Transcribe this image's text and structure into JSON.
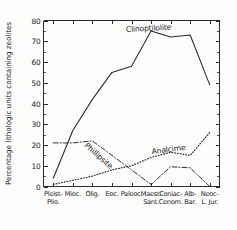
{
  "chart_data": {
    "type": "line",
    "title": "",
    "xlabel": "",
    "ylabel": "Percentage lithologic units containing zeolites",
    "ylim": [
      0,
      80
    ],
    "ytick_labels": [
      "0",
      "10",
      "20",
      "30",
      "40",
      "50",
      "60",
      "70",
      "80"
    ],
    "ytick_values": [
      0,
      10,
      20,
      30,
      40,
      50,
      60,
      70,
      80
    ],
    "yminor_step": 5,
    "grid": false,
    "legend": "inline-curve-labels",
    "categories": [
      "Pleist-\nPlio.",
      "Mioc.",
      "Olig.",
      "Eoc.",
      "Paleoc.",
      "Maest-\nSant.",
      "Coniac-\nCenom.",
      "Alb-\nBar.",
      "Neoc-\nL. Jur."
    ],
    "category_lines": [
      [
        "Pleist-",
        "Plio."
      ],
      [
        "Mioc.",
        ""
      ],
      [
        "Olig.",
        ""
      ],
      [
        "Eoc.",
        ""
      ],
      [
        "Paleoc.",
        ""
      ],
      [
        "Maest-",
        "Sant."
      ],
      [
        "Coniac-",
        "Cenom."
      ],
      [
        "Alb-",
        "Bar."
      ],
      [
        "Neoc-",
        "L. Jur."
      ]
    ],
    "series": [
      {
        "name": "Clinoptilolite",
        "style": "solid",
        "label_x_category_index": 5.4,
        "values": [
          4,
          27,
          42,
          55,
          58,
          75,
          72,
          73,
          49
        ]
      },
      {
        "name": "Phillipsite",
        "style": "dash-dot",
        "label_x_category_index": 2.6,
        "values": [
          21,
          21,
          22,
          15,
          8,
          1,
          9.5,
          9,
          0
        ]
      },
      {
        "name": "Analcime",
        "style": "dotted",
        "label_x_category_index": 5.6,
        "values": [
          1,
          3,
          5,
          8,
          10,
          14,
          16.5,
          15,
          26
        ]
      }
    ]
  },
  "colors": {
    "axis": "#2b2b2b",
    "ink": "#1a1a1a",
    "background": "#fdfdfc"
  }
}
